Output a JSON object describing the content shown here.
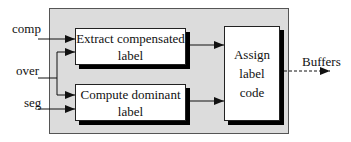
{
  "diagram": {
    "type": "block-diagram",
    "inputs": [
      {
        "id": "comp",
        "label": "comp"
      },
      {
        "id": "over",
        "label": "over"
      },
      {
        "id": "seg",
        "label": "seg"
      }
    ],
    "blocks": [
      {
        "id": "extract",
        "line1": "Extract compensated",
        "line2": "label"
      },
      {
        "id": "compute",
        "line1": "Compute dominant",
        "line2": "label"
      },
      {
        "id": "assign",
        "line1": "Assign",
        "line2": "label",
        "line3": "code"
      }
    ],
    "output": {
      "label": "Buffers",
      "style": "dashed"
    },
    "edges": [
      {
        "from": "comp",
        "to": "extract"
      },
      {
        "from": "over",
        "to": "extract"
      },
      {
        "from": "over",
        "to": "compute"
      },
      {
        "from": "seg",
        "to": "compute"
      },
      {
        "from": "extract",
        "to": "assign"
      },
      {
        "from": "compute",
        "to": "assign"
      },
      {
        "from": "assign",
        "to": "Buffers"
      }
    ],
    "colors": {
      "panel": "#dcdcdc",
      "box": "#ffffff",
      "shadow": "#000000",
      "line": "#111111"
    }
  }
}
